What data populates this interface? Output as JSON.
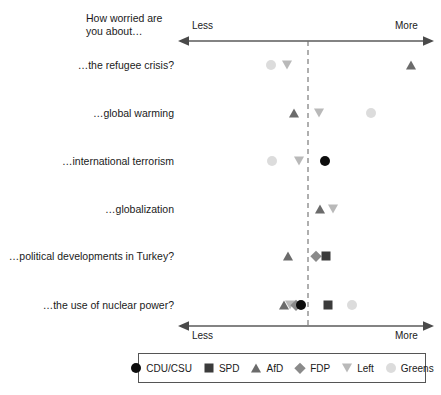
{
  "header": {
    "title": "How worried are\nyou about…"
  },
  "axis": {
    "left_label": "Less",
    "right_label": "More",
    "top_left_label": "Less",
    "top_right_label": "More",
    "x_min": 180,
    "x_max": 432,
    "center_line_x": 308,
    "center_dashed": true
  },
  "legend": {
    "position": "bottom",
    "items": [
      {
        "key": "cdu",
        "label": "CDU/CSU",
        "shape": "circle",
        "color": "#0d0d0d"
      },
      {
        "key": "spd",
        "label": "SPD",
        "shape": "square",
        "color": "#3b3b3b"
      },
      {
        "key": "afd",
        "label": "AfD",
        "shape": "triangle-up",
        "color": "#6b6b6b"
      },
      {
        "key": "fdp",
        "label": "FDP",
        "shape": "diamond",
        "color": "#8a8a8a"
      },
      {
        "key": "left",
        "label": "Left",
        "shape": "triangle-down",
        "color": "#b9b9b9"
      },
      {
        "key": "greens",
        "label": "Greens",
        "shape": "circle",
        "color": "#dcdcdc"
      }
    ]
  },
  "chart_data": {
    "type": "scatter",
    "title": "How worried are you about…",
    "xlabel": "Less — More",
    "ylabel": "",
    "xlim": [
      0,
      100
    ],
    "grid": false,
    "axis_ticks": [
      "Less",
      "More"
    ],
    "center_reference": 50,
    "categories": [
      "…the refugee crisis?",
      "…global warming",
      "…international terrorism",
      "…globalization",
      "…political developments in Turkey?",
      "…the use of nuclear power?"
    ],
    "series": [
      {
        "name": "CDU/CSU",
        "key": "cdu",
        "values": [
          null,
          null,
          57,
          null,
          null,
          48
        ]
      },
      {
        "name": "SPD",
        "key": "spd",
        "values": [
          null,
          null,
          null,
          null,
          57,
          59
        ]
      },
      {
        "name": "AfD",
        "key": "afd",
        "values": [
          91,
          45,
          null,
          55,
          43,
          41
        ]
      },
      {
        "name": "FDP",
        "key": "fdp",
        "values": [
          null,
          null,
          null,
          null,
          53,
          46
        ]
      },
      {
        "name": "Left",
        "key": "left",
        "values": [
          42,
          55,
          48,
          60,
          null,
          44
        ]
      },
      {
        "name": "Greens",
        "key": "greens",
        "values": [
          36,
          76,
          37,
          null,
          null,
          68
        ]
      }
    ],
    "points": [
      {
        "row": 0,
        "key": "greens",
        "x": 271
      },
      {
        "row": 0,
        "key": "left",
        "x": 287
      },
      {
        "row": 0,
        "key": "afd",
        "x": 411
      },
      {
        "row": 1,
        "key": "afd",
        "x": 294
      },
      {
        "row": 1,
        "key": "left",
        "x": 319
      },
      {
        "row": 1,
        "key": "greens",
        "x": 371
      },
      {
        "row": 2,
        "key": "greens",
        "x": 272
      },
      {
        "row": 2,
        "key": "left",
        "x": 299
      },
      {
        "row": 2,
        "key": "cdu",
        "x": 325
      },
      {
        "row": 3,
        "key": "afd",
        "x": 320
      },
      {
        "row": 3,
        "key": "left",
        "x": 333
      },
      {
        "row": 4,
        "key": "afd",
        "x": 288
      },
      {
        "row": 4,
        "key": "fdp",
        "x": 316
      },
      {
        "row": 4,
        "key": "spd",
        "x": 326
      },
      {
        "row": 5,
        "key": "afd",
        "x": 284
      },
      {
        "row": 5,
        "key": "left",
        "x": 290
      },
      {
        "row": 5,
        "key": "fdp",
        "x": 296
      },
      {
        "row": 5,
        "key": "cdu",
        "x": 301
      },
      {
        "row": 5,
        "key": "spd",
        "x": 328
      },
      {
        "row": 5,
        "key": "greens",
        "x": 352
      }
    ],
    "row_y": [
      65,
      113,
      161,
      209,
      256,
      305
    ]
  }
}
